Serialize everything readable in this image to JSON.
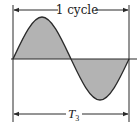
{
  "diagram": {
    "type": "sine-wave-period",
    "top_label": "1 cycle",
    "bottom_label": "T",
    "bottom_label_subscript": "3",
    "colors": {
      "line": "#2a2a2a",
      "fill": "#b3b3b3",
      "background": "#ffffff"
    }
  }
}
